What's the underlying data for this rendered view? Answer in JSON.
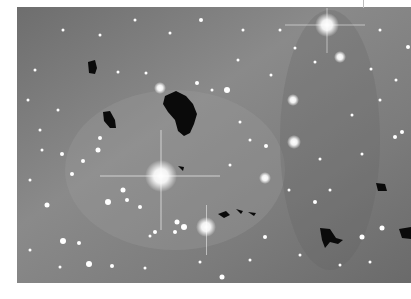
{
  "image": {
    "subject": "astronomical star field with dark globules against gray nebulosity",
    "mode": "grayscale",
    "background_color": "#7a7a7a",
    "border_color": "#ffffff",
    "bright_stars": [
      {
        "x": 161,
        "y": 176,
        "r": 9,
        "spikes": true
      },
      {
        "x": 327,
        "y": 25,
        "r": 7,
        "spikes": true
      },
      {
        "x": 206,
        "y": 227,
        "r": 6,
        "spikes": true
      },
      {
        "x": 294,
        "y": 142,
        "r": 5,
        "spikes": false
      },
      {
        "x": 265,
        "y": 178,
        "r": 4,
        "spikes": false
      },
      {
        "x": 293,
        "y": 100,
        "r": 4,
        "spikes": false
      },
      {
        "x": 340,
        "y": 57,
        "r": 4,
        "spikes": false
      },
      {
        "x": 108,
        "y": 202,
        "r": 3,
        "spikes": false
      },
      {
        "x": 89,
        "y": 264,
        "r": 3,
        "spikes": false
      },
      {
        "x": 63,
        "y": 241,
        "r": 3,
        "spikes": false
      },
      {
        "x": 227,
        "y": 90,
        "r": 3,
        "spikes": false
      },
      {
        "x": 160,
        "y": 88,
        "r": 3,
        "spikes": false
      },
      {
        "x": 47,
        "y": 205,
        "r": 2.5,
        "spikes": false
      },
      {
        "x": 382,
        "y": 228,
        "r": 2.5,
        "spikes": false
      },
      {
        "x": 362,
        "y": 237,
        "r": 2.5,
        "spikes": false
      },
      {
        "x": 184,
        "y": 227,
        "r": 3,
        "spikes": false
      },
      {
        "x": 177,
        "y": 222,
        "r": 2.5,
        "spikes": false
      }
    ],
    "dark_globules": [
      {
        "x": 181,
        "y": 110,
        "label": "large central globule"
      },
      {
        "x": 92,
        "y": 68
      },
      {
        "x": 108,
        "y": 120
      },
      {
        "x": 330,
        "y": 236
      },
      {
        "x": 380,
        "y": 187
      },
      {
        "x": 404,
        "y": 234
      },
      {
        "x": 230,
        "y": 212
      },
      {
        "x": 250,
        "y": 213
      }
    ]
  }
}
